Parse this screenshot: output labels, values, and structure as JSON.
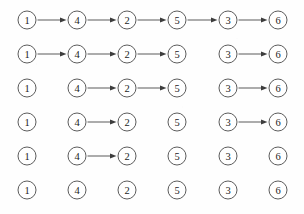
{
  "figure": {
    "type": "sequence-of-graph-states",
    "background_color": "#fefefe",
    "node_stroke_color": "#4a4a4a",
    "edge_color": "#3d3d3d",
    "label_color": "#1d1d1d",
    "node_radius": 9,
    "columns": [
      {
        "label": "1",
        "x": 27
      },
      {
        "label": "4",
        "x": 77
      },
      {
        "label": "2",
        "x": 127
      },
      {
        "label": "5",
        "x": 177
      },
      {
        "label": "3",
        "x": 228
      },
      {
        "label": "6",
        "x": 278
      }
    ],
    "rows": [
      {
        "y": 20,
        "nodes": [
          "1",
          "4",
          "2",
          "5",
          "3",
          "6"
        ],
        "edges": [
          {
            "from": 0,
            "to": 1
          },
          {
            "from": 1,
            "to": 2
          },
          {
            "from": 2,
            "to": 3
          },
          {
            "from": 3,
            "to": 4
          },
          {
            "from": 4,
            "to": 5
          }
        ]
      },
      {
        "y": 54,
        "nodes": [
          "1",
          "4",
          "2",
          "5",
          "3",
          "6"
        ],
        "edges": [
          {
            "from": 0,
            "to": 1
          },
          {
            "from": 1,
            "to": 2
          },
          {
            "from": 2,
            "to": 3
          },
          {
            "from": 4,
            "to": 5
          }
        ]
      },
      {
        "y": 88,
        "nodes": [
          "1",
          "4",
          "2",
          "5",
          "3",
          "6"
        ],
        "edges": [
          {
            "from": 1,
            "to": 2
          },
          {
            "from": 2,
            "to": 3
          },
          {
            "from": 4,
            "to": 5
          }
        ]
      },
      {
        "y": 122,
        "nodes": [
          "1",
          "4",
          "2",
          "5",
          "3",
          "6"
        ],
        "edges": [
          {
            "from": 1,
            "to": 2
          },
          {
            "from": 4,
            "to": 5
          }
        ]
      },
      {
        "y": 156,
        "nodes": [
          "1",
          "4",
          "2",
          "5",
          "3",
          "6"
        ],
        "edges": [
          {
            "from": 1,
            "to": 2
          }
        ]
      },
      {
        "y": 190,
        "nodes": [
          "1",
          "4",
          "2",
          "5",
          "3",
          "6"
        ],
        "edges": []
      }
    ]
  }
}
